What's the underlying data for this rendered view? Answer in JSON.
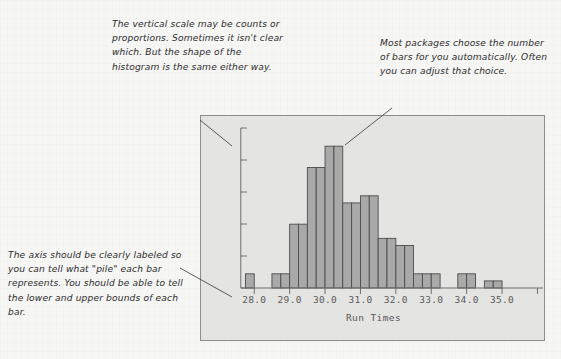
{
  "figure": {
    "panel_bg": "#e4e4e3",
    "page_bg": "#f6f6f5",
    "bar_fill": "#a9a9a9",
    "bar_stroke": "#4c4c4c",
    "axis_color": "#6f6f6f"
  },
  "annotations": [
    {
      "id": "note-vertical-scale",
      "name": "annotation-vertical-scale",
      "text": "The vertical scale may be counts or proportions. Sometimes it isn't clear which. But the shape of the histogram is the same either way."
    },
    {
      "id": "note-num-bars",
      "name": "annotation-number-of-bars",
      "text": "Most packages choose the number of bars for you automatically. Often you can adjust that choice."
    },
    {
      "id": "note-axis-label",
      "name": "annotation-axis-labeling",
      "text": "The axis should be clearly labeled so you can tell what \"pile\" each bar represents. You should be able to tell the lower and upper bounds of each bar."
    }
  ],
  "chart_data": {
    "type": "bar",
    "title": "",
    "subtitle": "",
    "xlabel": "Run Times",
    "ylabel": "",
    "grid": false,
    "legend": null,
    "y_axis": {
      "labels_shown": false,
      "tick_count": 5,
      "note": "vertical scale unlabeled; ticks only"
    },
    "x_tick_labels": [
      "28.0",
      "29.0",
      "30.0",
      "31.0",
      "32.0",
      "33.0",
      "34.0",
      "35.0"
    ],
    "x_tick_values": [
      28.0,
      29.0,
      30.0,
      31.0,
      32.0,
      33.0,
      34.0,
      35.0
    ],
    "xlim": [
      27.4,
      36.1
    ],
    "ylim": [
      0,
      22
    ],
    "bin_width": 0.25,
    "bins": [
      {
        "left": 27.75,
        "right": 28.0,
        "count": 2
      },
      {
        "left": 28.0,
        "right": 28.25,
        "count": 0
      },
      {
        "left": 28.25,
        "right": 28.5,
        "count": 0
      },
      {
        "left": 28.5,
        "right": 28.75,
        "count": 2
      },
      {
        "left": 28.75,
        "right": 29.0,
        "count": 2
      },
      {
        "left": 29.0,
        "right": 29.25,
        "count": 9
      },
      {
        "left": 29.25,
        "right": 29.5,
        "count": 9
      },
      {
        "left": 29.5,
        "right": 29.75,
        "count": 17
      },
      {
        "left": 29.75,
        "right": 30.0,
        "count": 17
      },
      {
        "left": 30.0,
        "right": 30.25,
        "count": 20
      },
      {
        "left": 30.25,
        "right": 30.5,
        "count": 20
      },
      {
        "left": 30.5,
        "right": 30.75,
        "count": 12
      },
      {
        "left": 30.75,
        "right": 31.0,
        "count": 12
      },
      {
        "left": 31.0,
        "right": 31.25,
        "count": 13
      },
      {
        "left": 31.25,
        "right": 31.5,
        "count": 13
      },
      {
        "left": 31.5,
        "right": 31.75,
        "count": 7
      },
      {
        "left": 31.75,
        "right": 32.0,
        "count": 7
      },
      {
        "left": 32.0,
        "right": 32.25,
        "count": 6
      },
      {
        "left": 32.25,
        "right": 32.5,
        "count": 6
      },
      {
        "left": 32.5,
        "right": 32.75,
        "count": 2
      },
      {
        "left": 32.75,
        "right": 33.0,
        "count": 2
      },
      {
        "left": 33.0,
        "right": 33.25,
        "count": 2
      },
      {
        "left": 33.25,
        "right": 33.5,
        "count": 0
      },
      {
        "left": 33.5,
        "right": 33.75,
        "count": 0
      },
      {
        "left": 33.75,
        "right": 34.0,
        "count": 2
      },
      {
        "left": 34.0,
        "right": 34.25,
        "count": 2
      },
      {
        "left": 34.25,
        "right": 34.5,
        "count": 0
      },
      {
        "left": 34.5,
        "right": 34.75,
        "count": 1
      },
      {
        "left": 34.75,
        "right": 35.0,
        "count": 1
      }
    ],
    "categories": [
      "28.0",
      "29.0",
      "30.0",
      "31.0",
      "32.0",
      "33.0",
      "34.0",
      "35.0"
    ],
    "values": [
      2,
      9,
      20,
      13,
      7,
      2,
      2,
      1
    ]
  }
}
